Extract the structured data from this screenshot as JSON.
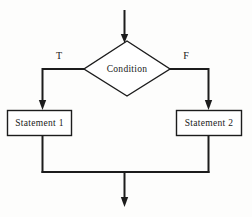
{
  "figure": {
    "type": "flowchart"
  },
  "nodes": {
    "decision": {
      "label": "Condition",
      "shape": "diamond"
    },
    "true_branch_statement": {
      "label": "Statement 1",
      "shape": "rectangle"
    },
    "false_branch_statement": {
      "label": "Statement 2",
      "shape": "rectangle"
    }
  },
  "edge_labels": {
    "true_label": "T",
    "false_label": "F"
  },
  "colors": {
    "line": "#1c1c1c",
    "text": "#1a1a1a",
    "shape_fill": "#ffffff",
    "background": "#fdfdfc"
  }
}
